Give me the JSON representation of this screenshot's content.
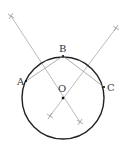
{
  "diagram": {
    "type": "geometry-construction",
    "colors": {
      "circle": "#222222",
      "chords": "#999999",
      "bisectors": "#aaaaaa",
      "points": "#111111",
      "labels": "#333333"
    },
    "circle": {
      "cx": 63,
      "cy": 98,
      "r": 41
    },
    "points": [
      {
        "id": "A",
        "label": "A",
        "x": 26,
        "y": 81,
        "label_x": 17,
        "label_y": 85
      },
      {
        "id": "B",
        "label": "B",
        "x": 63,
        "y": 56,
        "label_x": 59,
        "label_y": 52
      },
      {
        "id": "C",
        "label": "C",
        "x": 104,
        "y": 87,
        "label_x": 107,
        "label_y": 91
      },
      {
        "id": "O",
        "label": "O",
        "x": 63,
        "y": 98,
        "label_x": 58,
        "label_y": 92
      }
    ],
    "chords": [
      {
        "from": "A",
        "to": "B"
      },
      {
        "from": "B",
        "to": "C"
      }
    ],
    "bisectors": [
      {
        "name": "bisector-AB",
        "x1": 11,
        "y1": 16,
        "x2": 80,
        "y2": 122
      },
      {
        "name": "bisector-BC",
        "x1": 116,
        "y1": 28,
        "x2": 50,
        "y2": 116
      }
    ],
    "arc_marks": [
      {
        "x": 11,
        "y": 16
      },
      {
        "x": 80,
        "y": 122
      },
      {
        "x": 116,
        "y": 28
      },
      {
        "x": 50,
        "y": 116
      }
    ]
  }
}
